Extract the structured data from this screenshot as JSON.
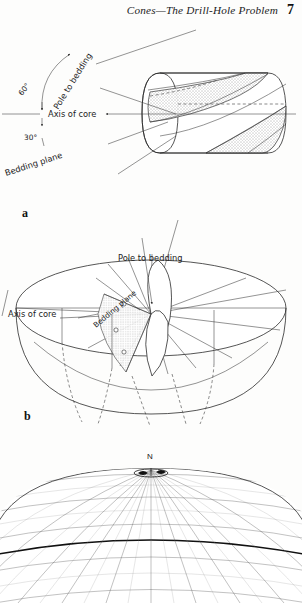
{
  "header": {
    "title": "Cones—The Drill-Hole Problem",
    "page_number": "7"
  },
  "figures": [
    {
      "id": "a",
      "panel_label": "a",
      "caption_labels": [
        {
          "name": "pole-to-bedding",
          "text": "Pole to bedding"
        },
        {
          "name": "angle-60",
          "text": "60°"
        },
        {
          "name": "axis-of-core",
          "text": "Axis of core"
        },
        {
          "name": "angle-30",
          "text": "30°"
        },
        {
          "name": "bedding-plane",
          "text": "Bedding plane"
        }
      ]
    },
    {
      "id": "b",
      "panel_label": "b",
      "caption_labels": [
        {
          "name": "pole-to-bedding",
          "text": "Pole to bedding"
        },
        {
          "name": "bedding-plane",
          "text": "Bedding plane"
        },
        {
          "name": "axis-of-core",
          "text": "Axis of core"
        }
      ]
    },
    {
      "id": "c",
      "panel_label": "",
      "caption_labels": [
        {
          "name": "north-pole",
          "text": "N"
        }
      ]
    }
  ],
  "colors": {
    "ink": "#2b2b2b",
    "paper": "#fdfdfc",
    "grid": "#5d5d5d",
    "grid_bold": "#111111"
  }
}
